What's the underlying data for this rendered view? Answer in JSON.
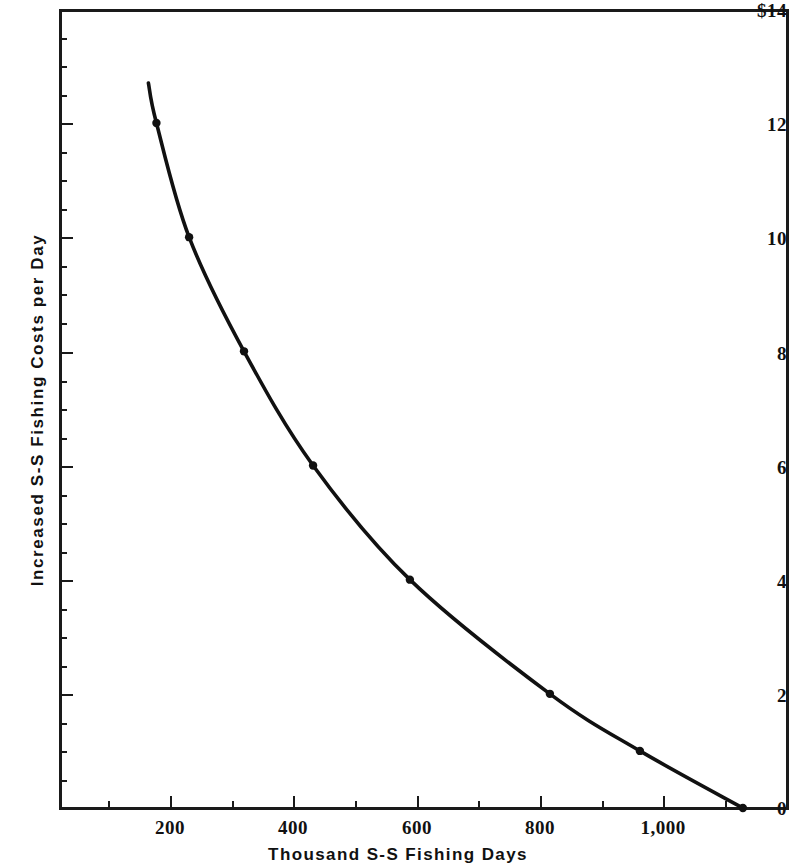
{
  "chart_data": {
    "type": "line",
    "title": "",
    "xlabel": "Thousand S-S Fishing Days",
    "ylabel": "Increased S-S Fishing Costs per Day",
    "xlim": [
      0,
      1180
    ],
    "ylim": [
      0,
      14
    ],
    "grid": false,
    "legend": null,
    "x_ticks": [
      200,
      400,
      600,
      800,
      1000
    ],
    "x_tick_labels": [
      "200",
      "400",
      "600",
      "800",
      "1,000"
    ],
    "y_ticks": [
      0,
      2,
      4,
      6,
      8,
      10,
      12,
      14
    ],
    "y_tick_labels": [
      "0",
      "2",
      "4",
      "6",
      "8",
      "10",
      "12",
      "$14"
    ],
    "series": [
      {
        "name": "Increased S-S Fishing Costs per Day",
        "marker": "filled-circle",
        "line_color": "#111111",
        "x": [
          165,
          178,
          231,
          320,
          432,
          589,
          816,
          962,
          1129
        ],
        "y": [
          12.7,
          12.0,
          10.0,
          8.0,
          6.0,
          4.0,
          2.0,
          1.0,
          0.0
        ],
        "points": [
          {
            "x": 178,
            "y": 12.0
          },
          {
            "x": 231,
            "y": 10.0
          },
          {
            "x": 320,
            "y": 8.0
          },
          {
            "x": 432,
            "y": 6.0
          },
          {
            "x": 589,
            "y": 4.0
          },
          {
            "x": 816,
            "y": 2.0
          },
          {
            "x": 962,
            "y": 1.0
          },
          {
            "x": 1129,
            "y": 0.0
          }
        ]
      }
    ]
  },
  "axes": {
    "y_title": "Increased S-S Fishing Costs per Day",
    "x_title": "Thousand S-S Fishing Days",
    "y_tick_labels": {
      "t14": "$14",
      "t12": "12",
      "t10": "10",
      "t8": "8",
      "t6": "6",
      "t4": "4",
      "t2": "2",
      "t0": "0"
    },
    "x_tick_labels": {
      "t200": "200",
      "t400": "400",
      "t600": "600",
      "t800": "800",
      "t1000": "1,000"
    }
  },
  "colors": {
    "ink": "#111111",
    "paper": "#ffffff"
  }
}
